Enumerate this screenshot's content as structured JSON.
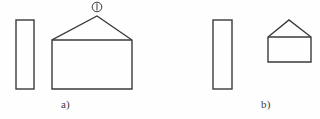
{
  "figure": {
    "type": "line-drawing",
    "background_color": "#fefefe",
    "stroke_color": "#3a3a3a",
    "stroke_width": 1.4,
    "panels": [
      {
        "id": "a",
        "label": "a)",
        "label_x": 61,
        "label_y": 99,
        "shapes": [
          {
            "name": "tall-rectangle",
            "kind": "rectangle",
            "x": 16,
            "y": 20,
            "width": 18,
            "height": 69
          },
          {
            "name": "house-pentagon",
            "kind": "pentagon",
            "points": "52,40 52,89 132,89 132,40 97,16",
            "body": {
              "x": 52,
              "y": 40,
              "width": 80,
              "height": 49
            },
            "apex_x": 97,
            "apex_y": 16
          }
        ],
        "annotations": [
          {
            "name": "callout-marker-1",
            "kind": "circled-number",
            "text": "1",
            "display": "①",
            "cx": 97,
            "cy": 7,
            "r": 5
          }
        ]
      },
      {
        "id": "b",
        "label": "b)",
        "label_x": 261,
        "label_y": 99,
        "shapes": [
          {
            "name": "tall-rectangle",
            "kind": "rectangle",
            "x": 213,
            "y": 20,
            "width": 19,
            "height": 69
          },
          {
            "name": "house-pentagon",
            "kind": "pentagon",
            "points": "268,37 268,62 311,62 311,37 289,20",
            "body": {
              "x": 268,
              "y": 37,
              "width": 43,
              "height": 25
            },
            "apex_x": 289,
            "apex_y": 20
          }
        ],
        "annotations": []
      }
    ]
  }
}
